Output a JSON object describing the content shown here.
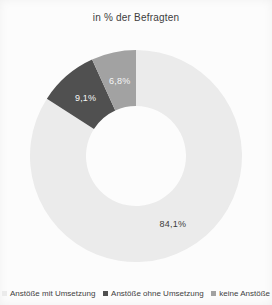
{
  "title": "in % der Befragten",
  "chart_data": {
    "type": "pie",
    "subtype": "donut",
    "title": "in % der Befragten",
    "unit": "%",
    "legend_position": "bottom",
    "start_angle_deg": 0,
    "direction": "clockwise",
    "background_color": "#fcfcfc",
    "slices": [
      {
        "label": "Anstöße mit Umsetzung",
        "value": 84.1,
        "display": "84,1%",
        "color": "#ebebeb",
        "label_color": "#3c3c3c"
      },
      {
        "label": "Anstöße ohne Umsetzung",
        "value": 9.1,
        "display": "9,1%",
        "color": "#505050",
        "label_color": "#f6f6f6"
      },
      {
        "label": "keine Anstöße",
        "value": 6.8,
        "display": "6,8%",
        "color": "#a2a2a2",
        "label_color": "#f6f6f6"
      }
    ]
  }
}
